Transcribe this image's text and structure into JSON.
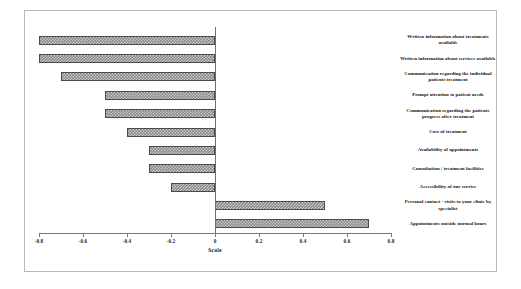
{
  "chart_data": {
    "type": "bar",
    "orientation": "horizontal",
    "title": "",
    "xlabel": "Scale",
    "ylabel": "",
    "xlim": [
      -0.8,
      0.8
    ],
    "xticks": [
      "-0.8",
      "-0.6",
      "-0.4",
      "-0.2",
      "0",
      "0.2",
      "0.4",
      "0.6",
      "0.8"
    ],
    "xtick_values": [
      -0.8,
      -0.6,
      -0.4,
      -0.2,
      0,
      0.2,
      0.4,
      0.6,
      0.8
    ],
    "grid": false,
    "legend": false,
    "bar_fill": "#8a8a8a",
    "bar_pattern": "crosshatch",
    "bar_edge": "#4a4a4a",
    "categories": [
      "Written information about treatments available",
      "Written information about services available",
      "Communication regarding the individual patients treatment",
      "Prompt attention to patient needs",
      "Communication regarding the patients progress after treatment",
      "Cost of treatment",
      "Availability of appointments",
      "Consultation / treatment facilities",
      "Accessibility of our service",
      "Personal contact - visits to your clinic by specialist",
      "Appointments outside normal hours"
    ],
    "values": [
      -0.8,
      -0.8,
      -0.7,
      -0.5,
      -0.5,
      -0.4,
      -0.3,
      -0.3,
      -0.2,
      0.5,
      0.7
    ]
  }
}
